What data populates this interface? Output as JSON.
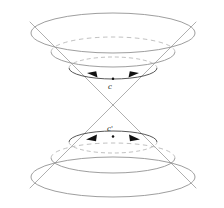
{
  "figure": {
    "background_color": "#ffffff",
    "width": 224,
    "height": 208
  },
  "style": {
    "solid_stroke": "#8c8c8c",
    "dashed_stroke": "#b0b0b0",
    "curve_stroke": "#3a3a3a",
    "slant_stroke": "#9a9a9a",
    "arrow_fill": "#111111",
    "point_fill": "#111111",
    "label_color": "#1a1a1a"
  },
  "labels": {
    "upper_curve_label": "c",
    "lower_curve_label": "c'"
  },
  "geometry": {
    "apex": {
      "x": 113,
      "y": 105
    },
    "slant_lines": [
      {
        "name": "upper-left-slant",
        "x1": 30,
        "y1": 22,
        "x2": 113,
        "y2": 105
      },
      {
        "name": "upper-right-slant",
        "x1": 196,
        "y1": 22,
        "x2": 113,
        "y2": 105
      },
      {
        "name": "lower-left-slant",
        "x1": 113,
        "y1": 105,
        "x2": 30,
        "y2": 188
      },
      {
        "name": "lower-right-slant",
        "x1": 113,
        "y1": 105,
        "x2": 196,
        "y2": 188
      }
    ],
    "upper_ellipses": [
      {
        "name": "upper-ellipse-outer",
        "cx": 113,
        "cy": 33,
        "rx": 82,
        "ry": 20
      },
      {
        "name": "upper-ellipse-middle",
        "cx": 113,
        "cy": 52,
        "rx": 62,
        "ry": 15
      },
      {
        "name": "upper-ellipse-inner",
        "cx": 113,
        "cy": 68,
        "rx": 44,
        "ry": 11
      }
    ],
    "lower_ellipses": [
      {
        "name": "lower-ellipse-inner",
        "cx": 113,
        "cy": 142,
        "rx": 44,
        "ry": 11
      },
      {
        "name": "lower-ellipse-middle",
        "cx": 113,
        "cy": 158,
        "rx": 62,
        "ry": 15
      },
      {
        "name": "lower-ellipse-outer",
        "cx": 113,
        "cy": 177,
        "rx": 82,
        "ry": 20
      }
    ],
    "upper_curve": {
      "name": "upper-closed-timelike-curve",
      "cx": 113,
      "cy": 68,
      "rx": 44,
      "ry": 11,
      "label_x": 110,
      "label_y": 89,
      "point_x": 113,
      "point_y": 79,
      "left_arrow_x": 92,
      "left_arrow_y": 76,
      "right_arrow_x": 134,
      "right_arrow_y": 76
    },
    "lower_curve": {
      "name": "lower-closed-timelike-curve",
      "cx": 113,
      "cy": 142,
      "rx": 44,
      "ry": 11,
      "label_x": 110,
      "label_y": 131,
      "point_x": 113,
      "point_y": 136,
      "left_arrow_x": 92,
      "left_arrow_y": 138,
      "right_arrow_x": 134,
      "right_arrow_y": 138
    }
  }
}
